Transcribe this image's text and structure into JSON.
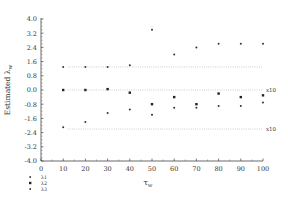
{
  "chart_data": {
    "type": "scatter",
    "title": "",
    "xlabel": "τ_w",
    "ylabel": "Estimated λ_w",
    "xlim": [
      0,
      100
    ],
    "ylim": [
      -4.0,
      4.0
    ],
    "xticks": [
      0,
      10,
      20,
      30,
      40,
      50,
      60,
      70,
      80,
      90,
      100
    ],
    "yticks": [
      4.0,
      3.2,
      2.4,
      1.6,
      0.8,
      0.0,
      -0.8,
      -1.6,
      -2.4,
      -3.2,
      -4.0
    ],
    "ytick_labels": [
      "4.0",
      "3.2",
      "2.4",
      "1.6",
      "0.8",
      "0.0",
      "-0.8",
      "-1.6",
      "-2.4",
      "-3.2",
      "-4.0"
    ],
    "grid": false,
    "legend_position": "bottom-left",
    "reference_lines": [
      {
        "y": 1.3,
        "style": "dotted",
        "label": ""
      },
      {
        "y": 0.0,
        "style": "dotted",
        "label": "x10"
      },
      {
        "y": -2.2,
        "style": "dotted",
        "label": "x10"
      }
    ],
    "series": [
      {
        "name": "λ1",
        "marker": "small-dot",
        "x": [
          10,
          20,
          30,
          40,
          50,
          60,
          70,
          80,
          90,
          100
        ],
        "values": [
          1.3,
          1.3,
          1.3,
          1.4,
          3.4,
          2.0,
          2.4,
          2.6,
          2.6,
          2.6
        ]
      },
      {
        "name": "λ2",
        "marker": "square",
        "x": [
          10,
          20,
          30,
          40,
          50,
          60,
          70,
          80,
          90,
          100
        ],
        "values": [
          0.0,
          0.0,
          0.05,
          -0.15,
          -0.8,
          -0.4,
          -0.8,
          -0.2,
          -0.4,
          -0.3
        ]
      },
      {
        "name": "λ3",
        "marker": "small-dot",
        "x": [
          10,
          20,
          30,
          40,
          50,
          60,
          70,
          80,
          90,
          100
        ],
        "values": [
          -2.1,
          -1.8,
          -1.3,
          -1.1,
          -1.4,
          -1.0,
          -1.0,
          -0.9,
          -0.9,
          -0.7
        ]
      }
    ],
    "annotations": [
      "x10",
      "x10"
    ]
  },
  "legend": {
    "items": [
      {
        "label": "λ1"
      },
      {
        "label": "λ2"
      },
      {
        "label": "λ3"
      }
    ]
  },
  "axis": {
    "xlabel_main": "τ",
    "xlabel_sub": "w",
    "ylabel_main": "Estimated λ",
    "ylabel_sub": "w"
  }
}
